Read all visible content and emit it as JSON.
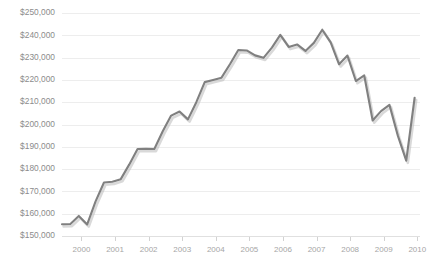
{
  "chart_data": {
    "type": "line",
    "title": "",
    "subtitle": "",
    "xlabel": "",
    "ylabel": "",
    "grid": true,
    "legend": false,
    "legend_position": "none",
    "line_color": "#808080",
    "gridline_color": "#ededed",
    "tick_label_color": "#8c8c8c",
    "ylim": [
      150000,
      250000
    ],
    "ytick_step": 10000,
    "ytick_labels": [
      "$150,000",
      "$160,000",
      "$170,000",
      "$180,000",
      "$190,000",
      "$200,000",
      "$210,000",
      "$220,000",
      "$230,000",
      "$240,000",
      "$250,000"
    ],
    "ytick_values": [
      150000,
      160000,
      170000,
      180000,
      190000,
      200000,
      210000,
      220000,
      230000,
      240000,
      250000
    ],
    "xtick_labels": [
      "2000",
      "2001",
      "2002",
      "2003",
      "2004",
      "2005",
      "2006",
      "2007",
      "2008",
      "2009",
      "2010"
    ],
    "xtick_values": [
      2000,
      2001,
      2002,
      2003,
      2004,
      2005,
      2006,
      2007,
      2008,
      2009,
      2010
    ],
    "xlim": [
      1999.42,
      2010.08
    ],
    "x": [
      1999.42,
      1999.67,
      1999.92,
      2000.17,
      2000.42,
      2000.67,
      2000.92,
      2001.17,
      2001.42,
      2001.67,
      2001.92,
      2002.17,
      2002.42,
      2002.67,
      2002.92,
      2003.17,
      2003.42,
      2003.67,
      2003.92,
      2004.17,
      2004.42,
      2004.67,
      2004.92,
      2005.17,
      2005.42,
      2005.67,
      2005.92,
      2006.17,
      2006.42,
      2006.67,
      2006.92,
      2007.17,
      2007.42,
      2007.67,
      2007.92,
      2008.17,
      2008.42,
      2008.67,
      2008.92,
      2009.17,
      2009.42,
      2009.67,
      2009.92
    ],
    "values": [
      155300,
      155400,
      159000,
      155200,
      165500,
      174000,
      174300,
      175500,
      182000,
      189000,
      189100,
      189000,
      197000,
      204000,
      205800,
      202300,
      210000,
      219000,
      220000,
      221000,
      227000,
      233400,
      233200,
      231000,
      229900,
      234500,
      240200,
      234800,
      235900,
      233000,
      236600,
      242500,
      236800,
      227000,
      230900,
      219500,
      222000,
      201800,
      206000,
      208800,
      195000,
      183800,
      212000
    ],
    "series_name": "Median Home Price",
    "notes": {
      "min_value": 155200,
      "max_value": 242500,
      "last_value": 212000
    }
  }
}
